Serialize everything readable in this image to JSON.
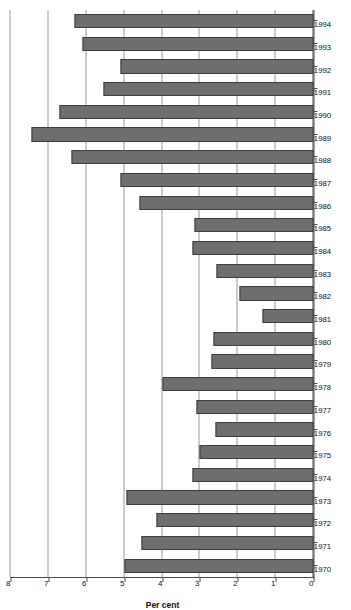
{
  "chart_data": {
    "type": "bar",
    "orientation": "horizontal",
    "title": "",
    "xlabel": "",
    "ylabel": "Per cent",
    "ylim": [
      0,
      8
    ],
    "yticks": [
      0,
      1,
      2,
      3,
      4,
      5,
      6,
      7,
      8
    ],
    "ytick_labels": [
      "0",
      "1",
      "2",
      "3",
      "4",
      "5",
      "6",
      "7",
      "8"
    ],
    "grid": true,
    "legend": "none",
    "bar_color": "#6e6e6e",
    "bar_edge_color": "#3d3d3d",
    "categories": [
      "1970",
      "1971",
      "1972",
      "1973",
      "1974",
      "1975",
      "1976",
      "1977",
      "1978",
      "1979",
      "1980",
      "1981",
      "1982",
      "1983",
      "1984",
      "1985",
      "1986",
      "1987",
      "1988",
      "1989",
      "1990",
      "1991",
      "1992",
      "1993",
      "1994"
    ],
    "values": [
      5.0,
      4.55,
      4.15,
      4.95,
      3.2,
      3.0,
      2.6,
      3.1,
      4.0,
      2.7,
      2.65,
      1.35,
      1.95,
      2.55,
      3.2,
      3.15,
      4.6,
      5.1,
      6.4,
      7.45,
      6.7,
      5.55,
      5.1,
      6.1,
      6.3
    ]
  },
  "axis": {
    "value_axis_title": "Per cent"
  }
}
